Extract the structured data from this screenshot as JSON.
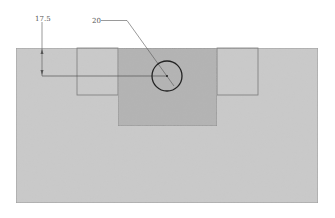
{
  "drawing": {
    "title": "",
    "dimensions": [
      {
        "id": "vertical-offset",
        "label": "17.5"
      },
      {
        "id": "hole-diameter",
        "label": "20"
      }
    ],
    "colors": {
      "plate": "#c9c9c9",
      "plate_edge": "#8a8a8a",
      "center_block": "#b4b4b4",
      "center_block_edge": "#7a7a7a",
      "side_pocket_edge": "#7c7c7c",
      "hole_stroke": "#222222",
      "dimension_line": "#555555"
    }
  }
}
